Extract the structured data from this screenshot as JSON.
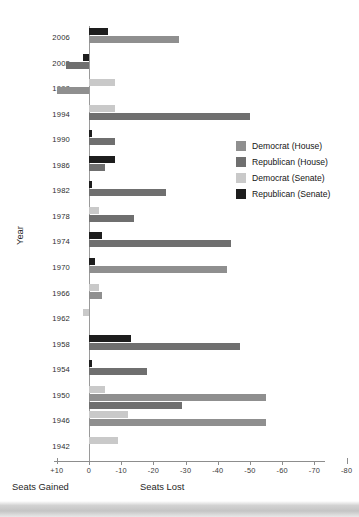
{
  "chart_data": {
    "type": "bar",
    "orientation": "horizontal",
    "title": "",
    "xlabel": "Seats Lost",
    "xlabel_left": "Seats Gained",
    "ylabel": "Year",
    "xlim": [
      10,
      -80
    ],
    "xticks": [
      10,
      0,
      -10,
      -20,
      -30,
      -40,
      -50,
      -60,
      -70,
      -80
    ],
    "xtick_labels": [
      "+10",
      "0",
      "-10",
      "-20",
      "-30",
      "-40",
      "-50",
      "-60",
      "-70",
      "-80"
    ],
    "grid": false,
    "legend_position": "right",
    "note": "Negative values = seats lost, positive values = seats gained",
    "categories": [
      "2006",
      "2002",
      "1998",
      "1994",
      "1990",
      "1986",
      "1982",
      "1978",
      "1974",
      "1970",
      "1966",
      "1962",
      "1958",
      "1954",
      "1950",
      "1946",
      "1942"
    ],
    "series": [
      {
        "name": "Democrat (House)",
        "color": "#8f8f8f",
        "values": [
          -28,
          null,
          10,
          null,
          null,
          null,
          null,
          null,
          null,
          -43,
          -4,
          null,
          null,
          null,
          -55,
          -55,
          null
        ]
      },
      {
        "name": "Republican (House)",
        "color": "#6f6f6f",
        "values": [
          null,
          7,
          null,
          -50,
          -8,
          -5,
          -24,
          -14,
          -44,
          null,
          null,
          null,
          -47,
          -18,
          -29,
          null,
          null
        ]
      },
      {
        "name": "Democrat (Senate)",
        "color": "#c9c9c9",
        "values": [
          null,
          null,
          -8,
          -8,
          null,
          null,
          null,
          -3,
          null,
          null,
          -3,
          2,
          null,
          null,
          -5,
          -12,
          -9
        ]
      },
      {
        "name": "Republican (Senate)",
        "color": "#1d1d1d",
        "values": [
          -6,
          2,
          null,
          null,
          -1,
          -8,
          -1,
          null,
          -4,
          -2,
          null,
          null,
          -13,
          -1,
          null,
          null,
          null
        ]
      }
    ]
  },
  "legend": {
    "items": [
      {
        "label": "Democrat (House)",
        "color": "#8f8f8f"
      },
      {
        "label": "Republican (House)",
        "color": "#6f6f6f"
      },
      {
        "label": "Democrat (Senate)",
        "color": "#c9c9c9"
      },
      {
        "label": "Republican (Senate)",
        "color": "#1d1d1d"
      }
    ]
  },
  "axes": {
    "y_title": "Year",
    "x_caption_left": "Seats Gained",
    "x_caption_right": "Seats Lost"
  }
}
